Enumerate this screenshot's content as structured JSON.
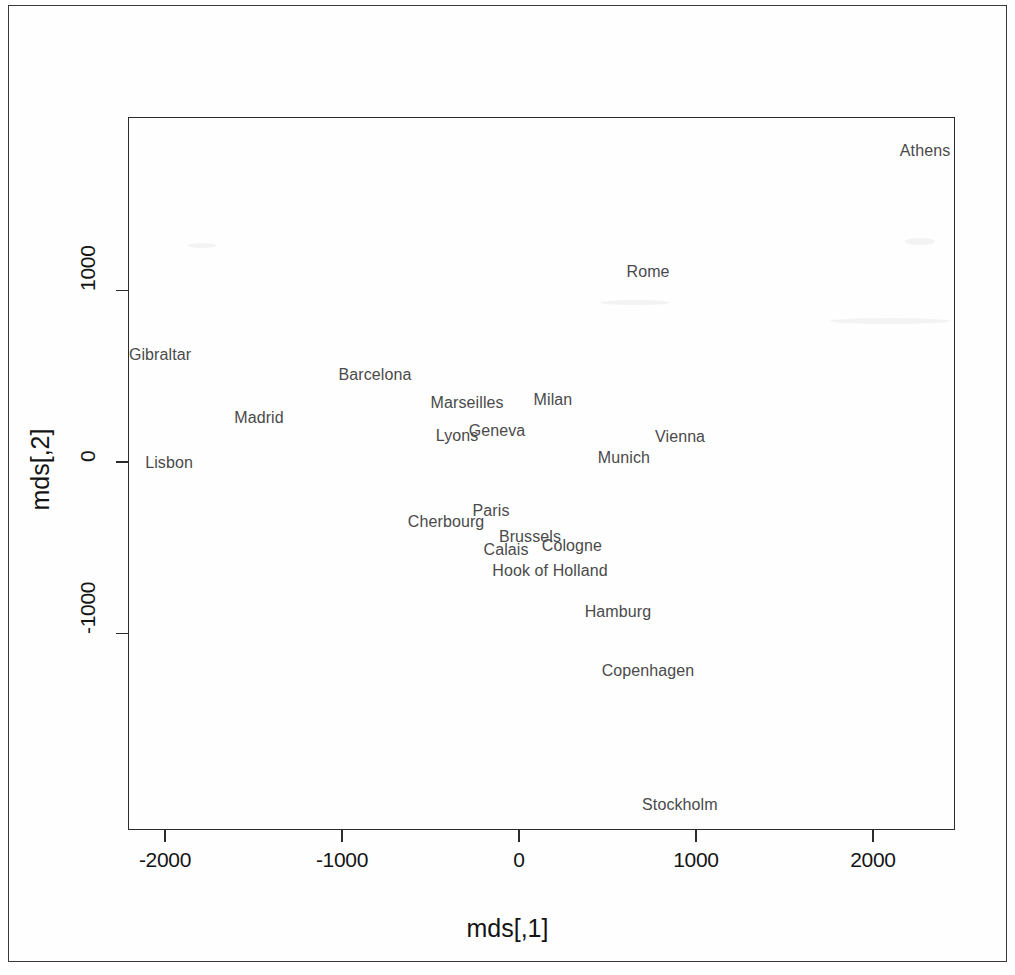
{
  "figure": {
    "kind": "scatter-text-plot",
    "x_axis_title": "mds[,1]",
    "y_axis_title": "mds[,2]"
  },
  "chart_data": {
    "type": "scatter",
    "title": "",
    "subtitle": "",
    "xlabel": "mds[,1]",
    "ylabel": "mds[,2]",
    "xlim": [
      -2210,
      2465
    ],
    "ylim": [
      -2015,
      1990
    ],
    "xticks": [
      -2000,
      -1000,
      0,
      1000,
      2000
    ],
    "yticks": [
      -1000,
      0,
      1000
    ],
    "xticklabels": [
      "-2000",
      "-1000",
      "0",
      "1000",
      "2000"
    ],
    "yticklabels": [
      "-1000",
      "0",
      "1000"
    ],
    "grid": false,
    "legend": false,
    "marker": "text-label",
    "points": [
      {
        "label": "Athens",
        "x": 2294,
        "y": 1813
      },
      {
        "label": "Rome",
        "x": 729,
        "y": 1108
      },
      {
        "label": "Gibraltar",
        "x": -2028,
        "y": 624
      },
      {
        "label": "Barcelona",
        "x": -814,
        "y": 507
      },
      {
        "label": "Marseilles",
        "x": -293,
        "y": 344
      },
      {
        "label": "Milan",
        "x": 192,
        "y": 362
      },
      {
        "label": "Madrid",
        "x": -1469,
        "y": 257
      },
      {
        "label": "Geneva",
        "x": -124,
        "y": 181
      },
      {
        "label": "Vienna",
        "x": 910,
        "y": 146
      },
      {
        "label": "Lyons",
        "x": -350,
        "y": 152
      },
      {
        "label": "Munich",
        "x": 593,
        "y": 23
      },
      {
        "label": "Lisbon",
        "x": -1977,
        "y": -6
      },
      {
        "label": "Paris",
        "x": -158,
        "y": -286
      },
      {
        "label": "Cherbourg",
        "x": -412,
        "y": -350
      },
      {
        "label": "Brussels",
        "x": 62,
        "y": -437
      },
      {
        "label": "Cologne",
        "x": 299,
        "y": -490
      },
      {
        "label": "Calais",
        "x": -73,
        "y": -513
      },
      {
        "label": "Hook of Holland",
        "x": 175,
        "y": -635
      },
      {
        "label": "Hamburg",
        "x": 559,
        "y": -875
      },
      {
        "label": "Copenhagen",
        "x": 729,
        "y": -1219
      },
      {
        "label": "Stockholm",
        "x": 909,
        "y": -2001
      }
    ]
  },
  "colors": {
    "page_border": "#3a3a3a",
    "axis": "#2b2b2b",
    "axis_text": "#141414",
    "label_text": "#4a4a4a",
    "background": "#ffffff"
  }
}
